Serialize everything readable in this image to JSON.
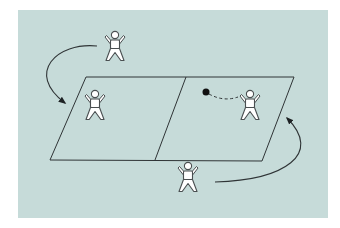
{
  "diagram": {
    "colors": {
      "page_background": "#ffffff",
      "panel_background": "#c6dbd9",
      "line": "#2f3436",
      "figure_fill": "#ffffff",
      "figure_outline": "#4a4f51",
      "ball": "#111111"
    },
    "panel": {
      "x": 18,
      "y": 10,
      "width": 310,
      "height": 208
    },
    "court": {
      "corners": {
        "top_left": [
          86,
          77
        ],
        "top_right": [
          294,
          77
        ],
        "bottom_right": [
          262,
          161
        ],
        "bottom_left": [
          50,
          160
        ]
      },
      "net_line": {
        "top": [
          186,
          77
        ],
        "bottom": [
          155,
          160
        ]
      }
    },
    "players": [
      {
        "id": "player-top-outside",
        "cx": 115,
        "top": 31,
        "scale": 1
      },
      {
        "id": "player-left-court",
        "cx": 95,
        "top": 90,
        "scale": 1
      },
      {
        "id": "player-right-court",
        "cx": 250,
        "top": 90,
        "scale": 1
      },
      {
        "id": "player-bottom-outside",
        "cx": 188,
        "top": 162,
        "scale": 1
      }
    ],
    "ball": {
      "cx": 206,
      "cy": 92,
      "r": 3.5
    },
    "ball_path": {
      "style": "dashed",
      "from": [
        209,
        94
      ],
      "to": [
        238,
        97
      ]
    },
    "arrows": [
      {
        "id": "arrow-left-rotation",
        "from": [
          97,
          46
        ],
        "to": [
          65,
          103
        ],
        "direction": "counterclockwise"
      },
      {
        "id": "arrow-right-rotation",
        "from": [
          215,
          182
        ],
        "to": [
          287,
          118
        ],
        "direction": "counterclockwise"
      }
    ]
  }
}
